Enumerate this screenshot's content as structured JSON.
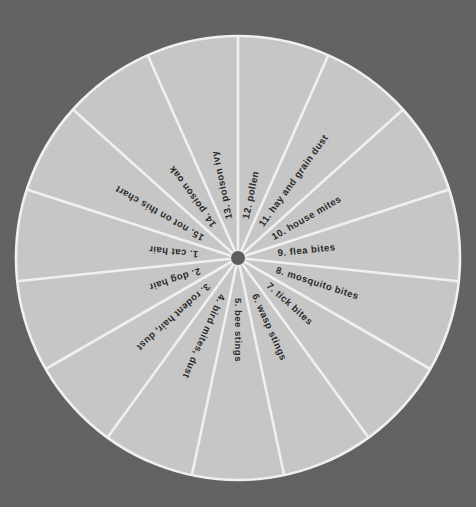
{
  "chart_data": {
    "type": "pie",
    "title": "",
    "subtitle": "",
    "xlabel": "",
    "ylabel": "",
    "legend_position": "none",
    "grid": false,
    "equal_slices": true,
    "slice_count": 15,
    "slice_degrees": 24,
    "start_angle_deg": 0,
    "direction": "clockwise",
    "categories": [
      "1.  cat hair",
      "2.  dog hair",
      "3.  rodent hair, dust",
      "4.  bird mites, dust",
      "5.  bee stings",
      "6.  wasp stings",
      "7.  tick bites",
      "8.  mosquito bites",
      "9.  flea bites",
      "10.  house mites",
      "11.  hay and grain dust",
      "12.  pollen",
      "13.  poison ivy",
      "14.  poison oak",
      "15.  not on this chart"
    ],
    "values": [
      6.667,
      6.667,
      6.667,
      6.667,
      6.667,
      6.667,
      6.667,
      6.667,
      6.667,
      6.667,
      6.667,
      6.667,
      6.667,
      6.667,
      6.667
    ],
    "value_unit": "percent"
  },
  "canvas": {
    "width": 476,
    "height": 507,
    "background_color": "#636363"
  },
  "wheel": {
    "name": "allergy-cause-wheel",
    "center_x": 238,
    "center_y": 258,
    "radius": 222,
    "slice_fill_color": "#c9c9c9",
    "divider_color": "#f4f4f4",
    "divider_width": 2.6,
    "rim_color": "#f4f4f4",
    "rim_width": 2.6,
    "hub_color": "#5e5e5e",
    "hub_radius": 7,
    "label_color": "#2a2a2a",
    "label_radius": 150,
    "slices": [
      {
        "index": 12,
        "label": "12.  pollen",
        "start_deg": 0,
        "end_deg": 24
      },
      {
        "index": 11,
        "label": "11.  hay and grain dust",
        "start_deg": 24,
        "end_deg": 48
      },
      {
        "index": 10,
        "label": "10.  house mites",
        "start_deg": 48,
        "end_deg": 72
      },
      {
        "index": 9,
        "label": "9.  flea bites",
        "start_deg": 72,
        "end_deg": 96
      },
      {
        "index": 8,
        "label": "8.  mosquito bites",
        "start_deg": 96,
        "end_deg": 120
      },
      {
        "index": 7,
        "label": "7.  tick bites",
        "start_deg": 120,
        "end_deg": 144
      },
      {
        "index": 6,
        "label": "6.  wasp stings",
        "start_deg": 144,
        "end_deg": 168
      },
      {
        "index": 5,
        "label": "5.  bee stings",
        "start_deg": 168,
        "end_deg": 192
      },
      {
        "index": 4,
        "label": "4.  bird mites, dust",
        "start_deg": 192,
        "end_deg": 216
      },
      {
        "index": 3,
        "label": "3.  rodent hair, dust",
        "start_deg": 216,
        "end_deg": 240
      },
      {
        "index": 2,
        "label": "2.  dog hair",
        "start_deg": 240,
        "end_deg": 264
      },
      {
        "index": 1,
        "label": "1.  cat hair",
        "start_deg": 264,
        "end_deg": 288
      },
      {
        "index": 15,
        "label": "15.  not on this chart",
        "start_deg": 288,
        "end_deg": 312
      },
      {
        "index": 14,
        "label": "14.  poison oak",
        "start_deg": 312,
        "end_deg": 336
      },
      {
        "index": 13,
        "label": "13.  poison ivy",
        "start_deg": 336,
        "end_deg": 360
      }
    ]
  }
}
